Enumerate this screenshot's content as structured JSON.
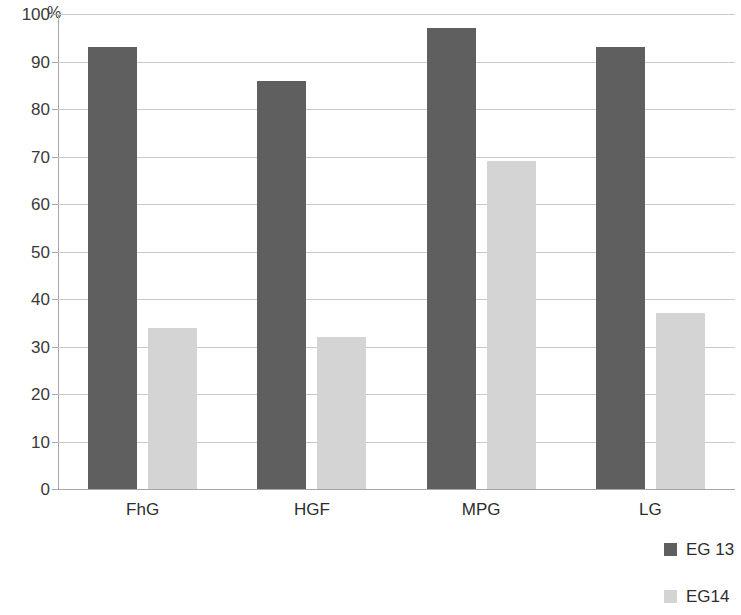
{
  "chart_data": {
    "type": "bar",
    "title": "",
    "subtitle": "",
    "xlabel": "",
    "ylabel": "%",
    "unit": "%",
    "categories": [
      "FhG",
      "HGF",
      "MPG",
      "LG"
    ],
    "series": [
      {
        "name": "EG 13",
        "color": "#5f5f5f",
        "values": [
          93,
          86,
          97,
          93
        ]
      },
      {
        "name": "EG14",
        "color": "#d4d4d4",
        "values": [
          34,
          32,
          69,
          37
        ]
      }
    ],
    "ylim": [
      0,
      100
    ],
    "ytick_step": 10,
    "ytick_labels": [
      "0",
      "10",
      "20",
      "30",
      "40",
      "50",
      "60",
      "70",
      "80",
      "90",
      "100"
    ],
    "grid": "horizontal",
    "legend_position": "bottom-right",
    "background": "#ffffff",
    "axis_color": "#a6a6a6",
    "gridline_color": "#c9c9c9"
  },
  "legend": {
    "items": [
      {
        "label": "EG 13",
        "color": "#5f5f5f"
      },
      {
        "label": "EG14",
        "color": "#d4d4d4"
      }
    ]
  }
}
